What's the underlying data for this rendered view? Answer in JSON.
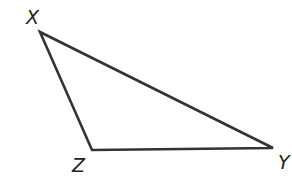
{
  "diagram": {
    "type": "triangle",
    "stroke_color": "#333333",
    "vertices": [
      {
        "label": "X",
        "x": 40,
        "y": 32,
        "label_x": 26,
        "label_y": 24
      },
      {
        "label": "Y",
        "x": 273,
        "y": 148,
        "label_x": 278,
        "label_y": 169
      },
      {
        "label": "Z",
        "x": 92,
        "y": 150,
        "label_x": 72,
        "label_y": 172
      }
    ]
  }
}
